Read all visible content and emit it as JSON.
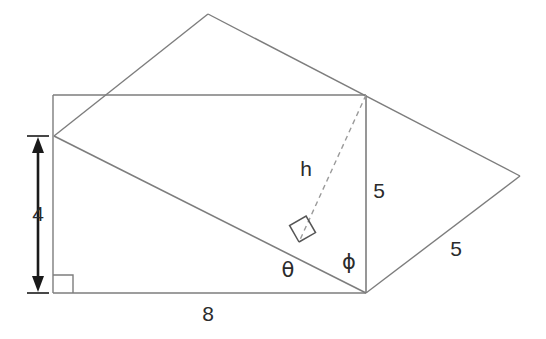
{
  "figure": {
    "background_color": "#ffffff",
    "line_color": "#7d7d7d",
    "text_color": "#2b2b2b",
    "dash_color": "#9a9a9a"
  },
  "labels": {
    "height_side": "4",
    "base_side": "8",
    "vertical_five": "5",
    "slant_five": "5",
    "altitude": "h",
    "angle_theta": "θ",
    "angle_phi": "ϕ"
  },
  "geometry": {
    "rectangle": {
      "top_left": [
        53,
        95
      ],
      "top_right": [
        366,
        95
      ],
      "bottom_right": [
        366,
        293
      ],
      "bottom_left": [
        53,
        293
      ]
    },
    "left_vertex": [
      54,
      136
    ],
    "apex_top": [
      208,
      14
    ],
    "right_vertex": [
      520,
      176
    ],
    "bottom_vertex": [
      366,
      293
    ],
    "dashed_altitude": [
      [
        366,
        95
      ],
      [
        299,
        242
      ]
    ],
    "right_angle_markers": [
      {
        "name": "corner-square-bottom-left",
        "position": [
          55,
          276
        ],
        "size": 18,
        "rotation": 0
      },
      {
        "name": "altitude-foot-square",
        "position": [
          299,
          242
        ],
        "size": 19,
        "rotation": -26
      }
    ],
    "dimension_arrow": {
      "x": 38,
      "y_top": 136,
      "y_bottom": 293,
      "tick_half_width": 11
    }
  },
  "label_positions": {
    "height_side": [
      38,
      215
    ],
    "base_side": [
      208,
      315
    ],
    "vertical_five": [
      379,
      192
    ],
    "slant_five": [
      456,
      250
    ],
    "altitude": [
      306,
      170
    ],
    "angle_theta": [
      288,
      271
    ],
    "angle_phi": [
      349,
      263
    ]
  }
}
